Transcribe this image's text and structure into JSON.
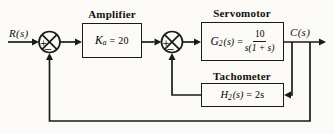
{
  "diagram": {
    "background_color": "#fbfaf7",
    "line_color": "#1a1a1a",
    "signals": {
      "input": "R(s)",
      "output": "C(s)"
    },
    "summing_junctions": [
      {
        "id": "summing-junction-1",
        "left_sign": "+",
        "bottom_sign": "−"
      },
      {
        "id": "summing-junction-2",
        "left_sign": "+",
        "bottom_sign": "−"
      }
    ],
    "blocks": {
      "amplifier": {
        "label": "Amplifier",
        "formula": {
          "sym": "K",
          "sub": "a",
          "rest": "= 20"
        }
      },
      "servomotor": {
        "label": "Servomotor",
        "formula": {
          "sym": "G",
          "sub": "2",
          "arg": "(s)",
          "eq": "=",
          "numerator": "10",
          "denominator": "s(1 + s)"
        }
      },
      "tachometer": {
        "label": "Tachometer",
        "formula": {
          "sym": "H",
          "sub": "2",
          "arg": "(s)",
          "rest": "= 2s"
        }
      }
    }
  }
}
